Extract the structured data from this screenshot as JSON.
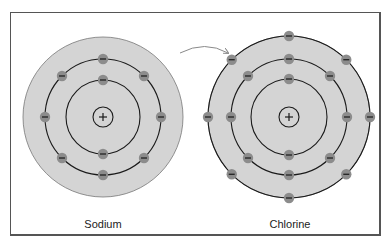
{
  "title_fragment": "",
  "atoms": [
    {
      "name": "Sodium",
      "center": [
        103,
        117
      ],
      "shell_radius": 80,
      "orbits": [
        37,
        58
      ],
      "nucleus_radius": 10,
      "nucleus_symbol": "+",
      "electrons_per_orbit": [
        2,
        8
      ],
      "label_x": 103
    },
    {
      "name": "Chlorine",
      "center": [
        289,
        117
      ],
      "shell_radius": 81,
      "orbits": [
        38,
        58,
        81
      ],
      "nucleus_radius": 10,
      "nucleus_symbol": "+",
      "electrons_per_orbit": [
        2,
        8,
        8
      ],
      "label_x": 290
    }
  ],
  "arrow": {
    "description": "electron transfer from Sodium to Chlorine",
    "from": [
      180,
      53
    ],
    "control": [
      205,
      40
    ],
    "to": [
      228,
      53
    ]
  },
  "colors": {
    "shell_fill": "#d4d4d4",
    "orbit_stroke": "#1a1a1a",
    "electron_fill": "#8c8c8c",
    "electron_sign": "#222222",
    "arrow": "#8a8a8a",
    "frame": "#555555"
  },
  "labels": {
    "sodium": "Sodium",
    "chlorine": "Chlorine"
  }
}
